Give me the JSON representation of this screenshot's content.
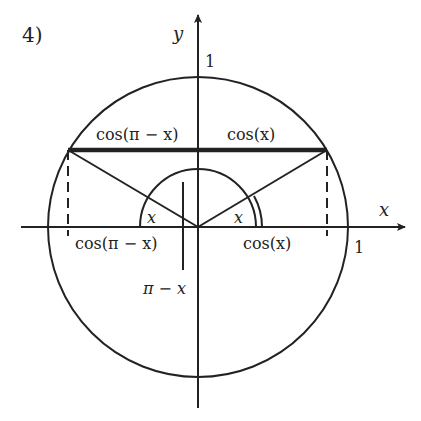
{
  "figure": {
    "number_label": "4)",
    "axes": {
      "x_label": "x",
      "y_label": "y",
      "x_unit_label": "1",
      "y_unit_label": "1"
    },
    "labels": {
      "top_left_segment": "cos(π − x)",
      "top_right_segment": "cos(x)",
      "axis_left_segment": "cos(π − x)",
      "axis_right_segment": "cos(x)",
      "left_angle": "x",
      "right_angle": "x",
      "obtuse_angle": "π − x"
    },
    "colors": {
      "ink": "#222222",
      "background": "#ffffff"
    }
  }
}
